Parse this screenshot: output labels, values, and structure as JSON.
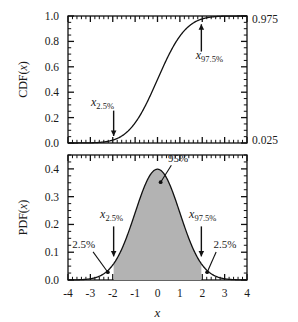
{
  "figure": {
    "title_partial": "",
    "x_axis_label": "x",
    "cdf_axis_label_prefix": "CDF(",
    "cdf_axis_label_var": "x",
    "cdf_axis_label_suffix": ")",
    "pdf_axis_label_prefix": "PDF(",
    "pdf_axis_label_var": "x",
    "pdf_axis_label_suffix": ")"
  },
  "chart_data": [
    {
      "type": "line",
      "name": "cdf-panel",
      "title": "",
      "xlabel": "x",
      "ylabel": "CDF(x)",
      "xlim": [
        -4,
        4
      ],
      "ylim": [
        0,
        1
      ],
      "xticks": [
        -4,
        -3,
        -2,
        -1,
        0,
        1,
        2,
        3,
        4
      ],
      "xticklabels": [
        "",
        "",
        "",
        "",
        "",
        "",
        "",
        "",
        ""
      ],
      "yticks": [
        0.0,
        0.2,
        0.4,
        0.6,
        0.8,
        1.0
      ],
      "yticklabels": [
        "0.0",
        "0.2",
        "0.4",
        "0.6",
        "0.8",
        "1.0"
      ],
      "right_axis_labels": [
        {
          "value": 0.975,
          "text": "0.975"
        },
        {
          "value": 0.025,
          "text": "0.025"
        }
      ],
      "grid": false,
      "minor_ticks": true,
      "series": [
        {
          "name": "standard normal CDF",
          "x": [
            -4.0,
            -3.75,
            -3.5,
            -3.25,
            -3.0,
            -2.75,
            -2.5,
            -2.25,
            -2.0,
            -1.75,
            -1.5,
            -1.25,
            -1.0,
            -0.75,
            -0.5,
            -0.25,
            0.0,
            0.25,
            0.5,
            0.75,
            1.0,
            1.25,
            1.5,
            1.75,
            2.0,
            2.25,
            2.5,
            2.75,
            3.0,
            3.25,
            3.5,
            3.75,
            4.0
          ],
          "y": [
            3e-05,
            9e-05,
            0.00023,
            0.00058,
            0.00135,
            0.00298,
            0.00621,
            0.01222,
            0.02275,
            0.04006,
            0.06681,
            0.10565,
            0.15866,
            0.22663,
            0.30854,
            0.40129,
            0.5,
            0.59871,
            0.69146,
            0.77337,
            0.84134,
            0.89435,
            0.93319,
            0.95994,
            0.97725,
            0.98778,
            0.99379,
            0.99702,
            0.99865,
            0.99942,
            0.99977,
            0.99991,
            0.99997
          ]
        }
      ],
      "annotations": [
        {
          "name": "x-2.5-percent",
          "base": "x",
          "sub": "2.5%",
          "x": -1.96,
          "y": 0.025,
          "arrow": "down"
        },
        {
          "name": "x-97.5-percent",
          "base": "x",
          "sub": "97.5%",
          "x": 1.96,
          "y": 0.975,
          "arrow": "up"
        }
      ]
    },
    {
      "type": "area",
      "name": "pdf-panel",
      "title": "",
      "xlabel": "x",
      "ylabel": "PDF(x)",
      "xlim": [
        -4,
        4
      ],
      "ylim": [
        0,
        0.45
      ],
      "xticks": [
        -4,
        -3,
        -2,
        -1,
        0,
        1,
        2,
        3,
        4
      ],
      "xticklabels": [
        "-4",
        "-3",
        "-2",
        "-1",
        "0",
        "1",
        "2",
        "3",
        "4"
      ],
      "yticks": [
        0.0,
        0.1,
        0.2,
        0.3,
        0.4
      ],
      "yticklabels": [
        "0.0",
        "0.1",
        "0.2",
        "0.3",
        "0.4"
      ],
      "grid": false,
      "minor_ticks": true,
      "fill_color": "#b3b3b3",
      "fill_range": [
        -1.96,
        1.96
      ],
      "fill_area_label": "95%",
      "series": [
        {
          "name": "standard normal PDF",
          "x": [
            -4.0,
            -3.75,
            -3.5,
            -3.25,
            -3.0,
            -2.75,
            -2.5,
            -2.25,
            -2.0,
            -1.75,
            -1.5,
            -1.25,
            -1.0,
            -0.75,
            -0.5,
            -0.25,
            0.0,
            0.25,
            0.5,
            0.75,
            1.0,
            1.25,
            1.5,
            1.75,
            2.0,
            2.25,
            2.5,
            2.75,
            3.0,
            3.25,
            3.5,
            3.75,
            4.0
          ],
          "y": [
            0.00013,
            0.00034,
            0.00087,
            0.00203,
            0.00443,
            0.00909,
            0.01753,
            0.03174,
            0.05399,
            0.08628,
            0.12952,
            0.18265,
            0.24197,
            0.30114,
            0.35207,
            0.38667,
            0.39894,
            0.38667,
            0.35207,
            0.30114,
            0.24197,
            0.18265,
            0.12952,
            0.08628,
            0.05399,
            0.03174,
            0.01753,
            0.00909,
            0.00443,
            0.00203,
            0.00087,
            0.00034,
            0.00013
          ]
        }
      ],
      "annotations": [
        {
          "name": "area-95-percent",
          "text": "95%",
          "x": 0.0,
          "y": 0.39894
        },
        {
          "name": "left-tail-2.5-percent",
          "text": "2.5%",
          "x": -2.3,
          "y": 0.02
        },
        {
          "name": "right-tail-2.5-percent",
          "text": "2.5%",
          "x": 2.3,
          "y": 0.02
        },
        {
          "name": "x-2.5-percent",
          "base": "x",
          "sub": "2.5%",
          "x": -1.96,
          "y": 0.0584,
          "arrow": "down"
        },
        {
          "name": "x-97.5-percent",
          "base": "x",
          "sub": "97.5%",
          "x": 1.96,
          "y": 0.0584,
          "arrow": "down"
        }
      ]
    }
  ]
}
